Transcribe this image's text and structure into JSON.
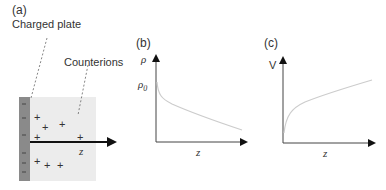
{
  "panel_a": {
    "label": "(a)",
    "plate_label": "Charged plate",
    "counterions_label": "Counterions",
    "axis_label": "z",
    "plate_charge_symbol": "−",
    "counterion_symbol": "+",
    "colors": {
      "plate": "#8a8a8a",
      "region": "#ececec",
      "arrow": "#111111"
    }
  },
  "panel_b": {
    "label": "(b)",
    "y_label": "ρ",
    "y_tick_label": "ρ0",
    "x_label": "z",
    "curve": "decreasing from ρ0"
  },
  "panel_c": {
    "label": "(c)",
    "y_label": "V",
    "x_label": "z",
    "curve": "increasing from 0"
  }
}
